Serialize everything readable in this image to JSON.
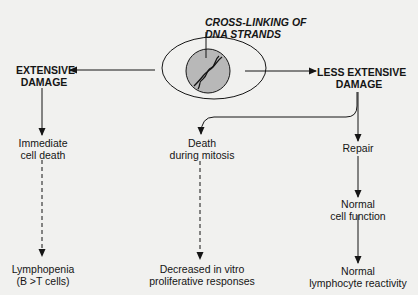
{
  "diagram": {
    "title": {
      "line1": "CROSS-LINKING OF",
      "line2": "DNA STRANDS"
    },
    "colors": {
      "background": "#f1f1ef",
      "ink": "#151515",
      "nucleus": "#b8b8b8"
    },
    "nodes": {
      "extensive_damage": {
        "line1": "EXTENSIVE",
        "line2": "DAMAGE"
      },
      "less_extensive_damage": {
        "line1": "LESS  EXTENSIVE",
        "line2": "DAMAGE"
      },
      "immediate_cell_death": {
        "line1": "Immediate",
        "line2": "cell death"
      },
      "lymphopenia": {
        "line1": "Lymphopenia",
        "line2": "(B >T cells)"
      },
      "death_during_mitosis": {
        "line1": "Death",
        "line2": "during mitosis"
      },
      "decreased_responses": {
        "line1": "Decreased in vitro",
        "line2": "proliferative responses"
      },
      "repair": {
        "line1": "Repair"
      },
      "normal_cell_function": {
        "line1": "Normal",
        "line2": "cell function"
      },
      "normal_reactivity": {
        "line1": "Normal",
        "line2": "lymphocyte reactivity"
      }
    },
    "edges": [
      {
        "from": "cell",
        "to": "extensive_damage",
        "style": "solid"
      },
      {
        "from": "cell",
        "to": "less_extensive_damage",
        "style": "solid"
      },
      {
        "from": "extensive_damage",
        "to": "immediate_cell_death",
        "style": "solid"
      },
      {
        "from": "immediate_cell_death",
        "to": "lymphopenia",
        "style": "dashed"
      },
      {
        "from": "less_extensive_damage",
        "to": "death_during_mitosis",
        "style": "solid"
      },
      {
        "from": "death_during_mitosis",
        "to": "decreased_responses",
        "style": "dashed"
      },
      {
        "from": "less_extensive_damage",
        "to": "repair",
        "style": "solid"
      },
      {
        "from": "repair",
        "to": "normal_cell_function",
        "style": "solid"
      },
      {
        "from": "normal_cell_function",
        "to": "normal_reactivity",
        "style": "solid"
      }
    ]
  }
}
